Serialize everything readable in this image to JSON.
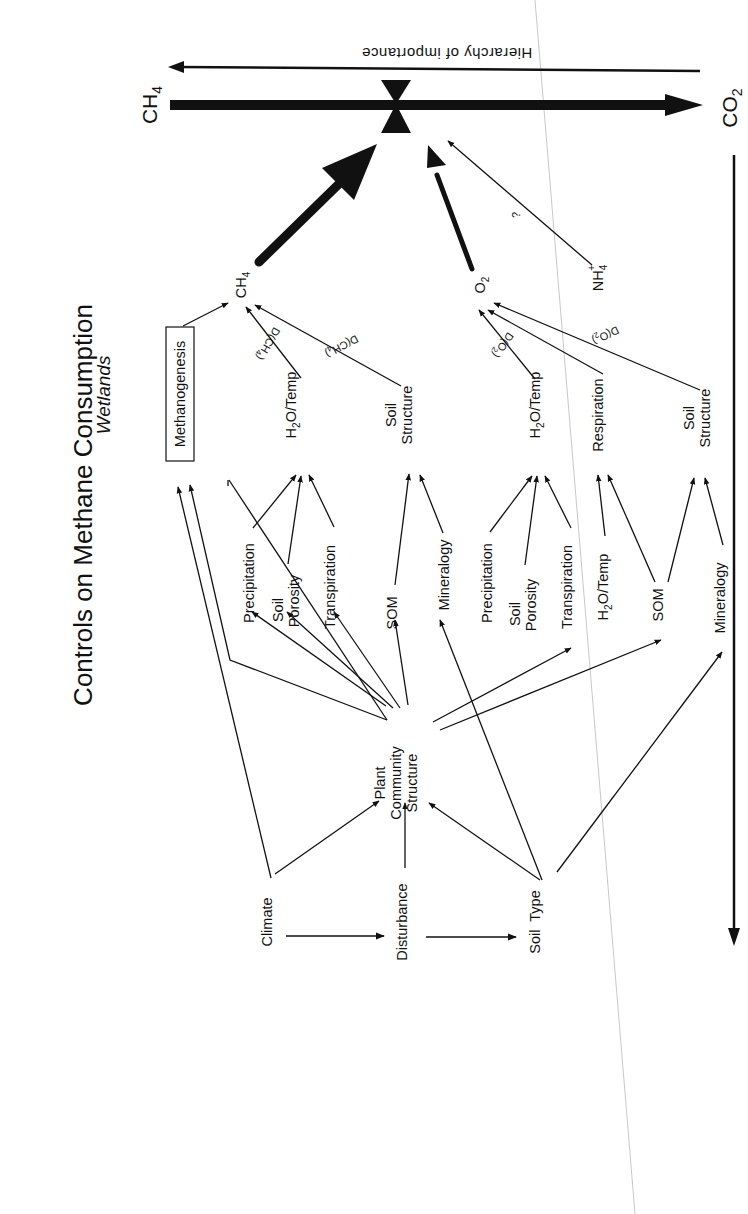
{
  "title": "Controls on Methane Consumption",
  "subtitle": "Wetlands",
  "hierarchy_label": "Hierarchy of importance",
  "endpoints": {
    "source": "CH4",
    "sink": "CO2"
  },
  "proximal": {
    "ch4": "CH4",
    "o2": "O2",
    "nh4": "NH4+",
    "nh4_link_label": "?"
  },
  "ch4_controls": {
    "methanogenesis": "Methanogenesis",
    "h2o_temp": "H2O/Temp",
    "soil_structure_line1": "Soil",
    "soil_structure_line2": "Structure",
    "diffusion_label_1": "D(CH4)",
    "diffusion_label_2": "D(CH4)"
  },
  "o2_controls": {
    "h2o_temp": "H2O/Temp",
    "respiration": "Respiration",
    "soil_structure_line1": "Soil",
    "soil_structure_line2": "Structure",
    "diffusion_label_1": "D(O2)",
    "diffusion_label_2": "D(O2)"
  },
  "ch4_drivers": {
    "precipitation": "Precipitation",
    "soil_porosity_line1": "Soil",
    "soil_porosity_line2": "Porosity",
    "transpiration": "Transpiration",
    "som": "SOM",
    "mineralogy": "Mineralogy"
  },
  "o2_drivers": {
    "precipitation": "Precipitation",
    "soil_porosity_line1": "Soil",
    "soil_porosity_line2": "Porosity",
    "transpiration": "Transpiration",
    "h2o_temp": "H2O/Temp",
    "som": "SOM",
    "mineralogy": "Mineralogy"
  },
  "plant_community": {
    "line1": "Plant",
    "line2": "Community",
    "line3": "Structure"
  },
  "ultimate_drivers": {
    "climate": "Climate",
    "disturbance": "Disturbance",
    "soil_type": "Soil  Type"
  },
  "colors": {
    "ink": "#111111",
    "background": "#ffffff",
    "fold_line": "#bdbdbd"
  }
}
